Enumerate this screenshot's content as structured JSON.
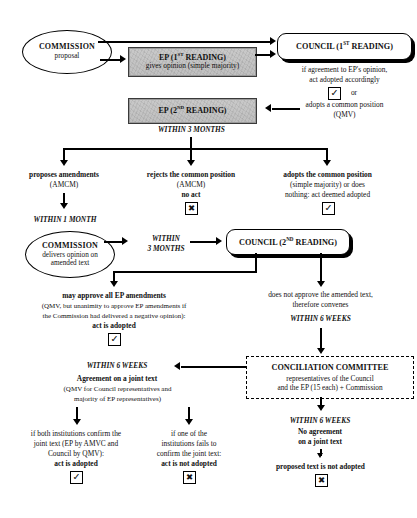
{
  "nodes": {
    "commission_proposal": {
      "line1": "COMMISSION",
      "line2": "proposal"
    },
    "ep_first_reading": {
      "line1": "EP (1ST READING)",
      "line1_main": "EP (1",
      "line1_sup": "ST",
      "line1_tail": " READING)",
      "line2": "gives opinion (simple majority)"
    },
    "council_first_reading": {
      "label_main": "COUNCIL  (1",
      "label_sup": "ST",
      "label_tail": " READING)",
      "label_full": "COUNCIL  (1ST READING)"
    },
    "ep_second_reading": {
      "label_main": "EP (2",
      "label_sup": "ND",
      "label_tail": " READING)",
      "label_full": "EP (2ND READING)"
    },
    "commission_opinion": {
      "line1": "COMMISSION",
      "line2": "delivers opinion on",
      "line3": "amended text"
    },
    "council_second_reading": {
      "label_main": "COUNCIL (2",
      "label_sup": "ND",
      "label_tail": " READING)",
      "label_full": "COUNCIL (2ND READING)"
    },
    "conciliation_committee": {
      "line1": "CONCILIATION COMMITTEE",
      "line2": "representatives of the Council",
      "line3": "and the EP (15 each) + Commission"
    }
  },
  "annotations": {
    "council1_outcome_line1": "if agreement to EP's opinion,",
    "council1_outcome_line2": "act adopted accordingly",
    "council1_or": "or",
    "council1_alt_line1": "adopts a common position",
    "council1_alt_line2": "(QMV)",
    "within_3_months_ep2": "WITHIN 3 MONTHS",
    "branch_amend_line1": "proposes amendments",
    "branch_amend_line2": "(AMCM)",
    "branch_reject_line1": "rejects the common position",
    "branch_reject_line2": "(AMCM)",
    "branch_reject_line3": "no act",
    "branch_adopt_line1": "adopts the common position",
    "branch_adopt_line2": "(simple majority) or does",
    "branch_adopt_line3": "nothing: act deemed adopted",
    "within_1_month": "WITHIN 1 MONTH",
    "within_3_months_mid_line1": "WITHIN",
    "within_3_months_mid_line2": "3 MONTHS",
    "approve_line1": "may approve all EP amendments",
    "approve_line2": "(QMV, but unanimity to approve EP amendments if",
    "approve_line3": "the Commission had delivered a negative opinion):",
    "approve_line4": "act is adopted",
    "notapprove_line1": "does not approve the amended text,",
    "notapprove_line2": "therefore convenes",
    "notapprove_within": "WITHIN 6 WEEKS",
    "agreement_within": "WITHIN 6 WEEKS",
    "agreement_line1": "Agreement on a joint text",
    "agreement_line2": "(QMV for Council representatives and",
    "agreement_line3": "majority of EP representatives)",
    "confirm_line1": "if both institutions confirm the",
    "confirm_line2": "joint text (EP by AMVC and",
    "confirm_line3": "Council by QMV):",
    "confirm_line4": "act is adopted",
    "fail_line1": "if one of the",
    "fail_line2": "institutions fails to",
    "fail_line3": "confirm the joint text:",
    "fail_line4": "act is not adopted",
    "noagree_within": "WITHIN 6 WEEKS",
    "noagree_line1": "No agreement",
    "noagree_line2": "on a joint text",
    "noagree_line3": "proposed text is not adopted"
  },
  "status_marks": {
    "check": "☑",
    "check_glyph": "✔",
    "cross_glyph": "✖",
    "adopted_council1": "check",
    "adopted_branch3": "check",
    "rejected_branch2": "cross",
    "adopted_approve": "check",
    "adopted_confirm": "check",
    "rejected_fail": "cross",
    "rejected_noagree": "cross"
  },
  "colors": {
    "ink": "#000000",
    "shaded_fill": "#c4c4c4",
    "page": "#ffffff"
  }
}
